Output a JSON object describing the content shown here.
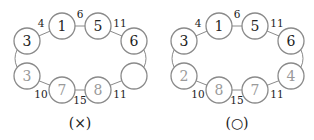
{
  "figures": [
    {
      "caption": "(×)",
      "nodes": {
        "top_left": "3",
        "top_mid_left": "1",
        "top_mid_right": "5",
        "top_right": "6",
        "bottom_left": "3",
        "bottom_mid_left": "7",
        "bottom_mid_right": "8",
        "bottom_right": ""
      },
      "edge_labels": {
        "tl_tml": "4",
        "tml_tmr": "6",
        "tmr_tr": "11",
        "bl_bml": "10",
        "bml_bmr": "15",
        "bmr_br": "11"
      }
    },
    {
      "caption": "(○)",
      "nodes": {
        "top_left": "3",
        "top_mid_left": "1",
        "top_mid_right": "5",
        "top_right": "6",
        "bottom_left": "2",
        "bottom_mid_left": "8",
        "bottom_mid_right": "7",
        "bottom_right": "4"
      },
      "edge_labels": {
        "tl_tml": "4",
        "tml_tmr": "6",
        "tmr_tr": "11",
        "bl_bml": "10",
        "bml_bmr": "15",
        "bmr_br": "11"
      }
    }
  ]
}
